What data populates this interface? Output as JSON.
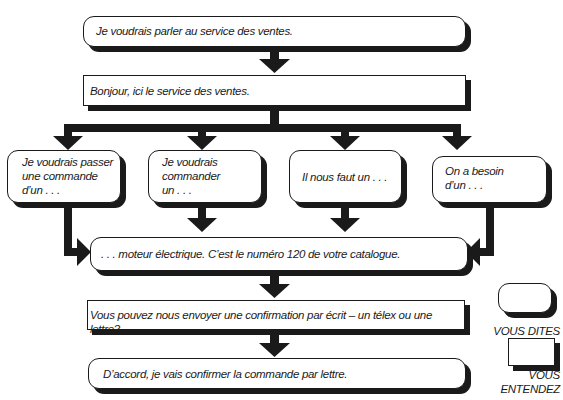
{
  "flowchart": {
    "nodes": [
      {
        "id": "n1",
        "type": "vous_dites",
        "text": "Je voudrais parler au service des ventes."
      },
      {
        "id": "n2",
        "type": "vous_entendez",
        "text": "Bonjour, ici le service des ventes."
      },
      {
        "id": "n3a",
        "type": "vous_dites",
        "text": "Je voudrais passer\nune commande\nd’un . . ."
      },
      {
        "id": "n3b",
        "type": "vous_dites",
        "text": "Je voudrais\ncommander\nun . . ."
      },
      {
        "id": "n3c",
        "type": "vous_dites",
        "text": "Il nous faut un . . ."
      },
      {
        "id": "n3d",
        "type": "vous_dites",
        "text": "On a besoin\nd’un . . ."
      },
      {
        "id": "n4",
        "type": "vous_dites",
        "text": ". . . moteur électrique. C’est le numéro 120 de votre catalogue."
      },
      {
        "id": "n5",
        "type": "vous_entendez",
        "text": "Vous pouvez nous envoyer une confirmation par écrit – un télex ou une lettre?"
      },
      {
        "id": "n6",
        "type": "vous_dites",
        "text": "D’accord, je vais confirmer la commande par lettre."
      }
    ],
    "edges": [
      [
        "n1",
        "n2"
      ],
      [
        "n2",
        "n3a"
      ],
      [
        "n2",
        "n3b"
      ],
      [
        "n2",
        "n3c"
      ],
      [
        "n2",
        "n3d"
      ],
      [
        "n3a",
        "n4"
      ],
      [
        "n3b",
        "n4"
      ],
      [
        "n3c",
        "n4"
      ],
      [
        "n3d",
        "n4"
      ],
      [
        "n4",
        "n5"
      ],
      [
        "n5",
        "n6"
      ]
    ]
  },
  "legend": {
    "vous_dites": "VOUS DITES",
    "vous_entendez_line1": "VOUS",
    "vous_entendez_line2": "ENTENDEZ"
  },
  "colors": {
    "ink": "#1a1a1a",
    "background": "#ffffff"
  }
}
